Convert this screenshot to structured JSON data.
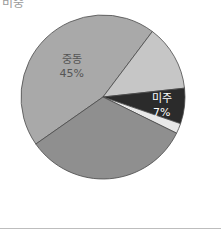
{
  "chart_data": {
    "type": "pie",
    "title": "비중",
    "start_angle_deg": 235,
    "center": [
      103,
      97
    ],
    "radius": 82,
    "slices": [
      {
        "label": "중동",
        "value": 45,
        "display": "45%",
        "color": "#a9a9a9",
        "text_color": "#555555",
        "show_label": true
      },
      {
        "label": "",
        "value": 13,
        "display": "",
        "color": "#c6c6c6",
        "text_color": "#555555",
        "show_label": false
      },
      {
        "label": "미주",
        "value": 7,
        "display": "7%",
        "color": "#2b2b2b",
        "text_color": "#ffffff",
        "show_label": true
      },
      {
        "label": "",
        "value": 2,
        "display": "",
        "color": "#e8e8e8",
        "text_color": "#555555",
        "show_label": false
      },
      {
        "label": "",
        "value": 33,
        "display": "",
        "color": "#8f8f8f",
        "text_color": "#555555",
        "show_label": false
      }
    ],
    "categories": [
      "중동",
      "(unlabeled)",
      "미주",
      "(unlabeled)",
      "(unlabeled)"
    ],
    "values": [
      45,
      13,
      7,
      2,
      33
    ]
  },
  "header": {
    "clipped_title": "비중"
  }
}
